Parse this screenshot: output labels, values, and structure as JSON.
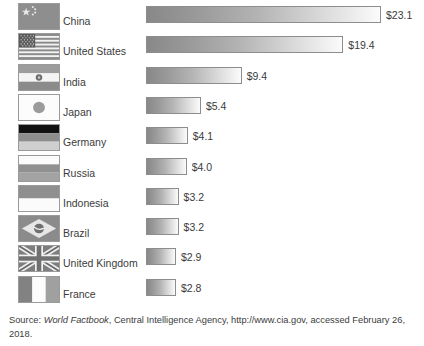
{
  "chart_data": {
    "type": "bar",
    "orientation": "horizontal",
    "title": "",
    "subtitle": "",
    "xlabel": "",
    "ylabel": "",
    "unit": "trillion US dollars",
    "value_prefix": "$",
    "xlim": [
      0,
      23.1
    ],
    "grid": false,
    "legend": "none",
    "categories": [
      "China",
      "United States",
      "India",
      "Japan",
      "Germany",
      "Russia",
      "Indonesia",
      "Brazil",
      "United Kingdom",
      "France"
    ],
    "values": [
      23.1,
      19.4,
      9.4,
      5.4,
      4.1,
      4.0,
      3.2,
      3.2,
      2.9,
      2.8
    ],
    "value_labels": [
      "$23.1",
      "$19.4",
      "$9.4",
      "$5.4",
      "$4.1",
      "$4.0",
      "$3.2",
      "$3.2",
      "$2.9",
      "$2.8"
    ]
  },
  "rows": [
    {
      "country": "China",
      "value_label": "$23.1",
      "flag": "flag-china"
    },
    {
      "country": "United States",
      "value_label": "$19.4",
      "flag": "flag-united-states"
    },
    {
      "country": "India",
      "value_label": "$9.4",
      "flag": "flag-india"
    },
    {
      "country": "Japan",
      "value_label": "$5.4",
      "flag": "flag-japan"
    },
    {
      "country": "Germany",
      "value_label": "$4.1",
      "flag": "flag-germany"
    },
    {
      "country": "Russia",
      "value_label": "$4.0",
      "flag": "flag-russia"
    },
    {
      "country": "Indonesia",
      "value_label": "$3.2",
      "flag": "flag-indonesia"
    },
    {
      "country": "Brazil",
      "value_label": "$3.2",
      "flag": "flag-brazil"
    },
    {
      "country": "United Kingdom",
      "value_label": "$2.9",
      "flag": "flag-united-kingdom"
    },
    {
      "country": "France",
      "value_label": "$2.8",
      "flag": "flag-france"
    }
  ],
  "source": {
    "lead": "Source: ",
    "publication": "World Factbook",
    "rest": ", Central Intelligence Agency, http://www.cia.gov, accessed February 26, 2018."
  },
  "colors": {
    "background": "#ffffff",
    "text": "#3b3b3b",
    "bar_start": "#888888",
    "bar_end": "#fbfbfb",
    "bar_border": "#8d8d8d",
    "flag_border": "#9a9a9a"
  }
}
